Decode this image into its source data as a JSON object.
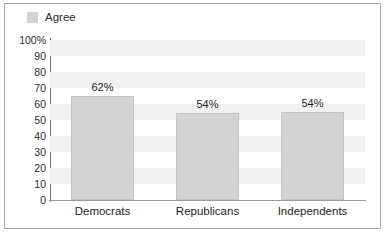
{
  "chart_data": {
    "type": "bar",
    "title": "",
    "xlabel": "",
    "ylabel": "",
    "categories": [
      "Democrats",
      "Republicans",
      "Independents"
    ],
    "values": [
      62,
      54,
      54
    ],
    "bar_heights": [
      65,
      54.5,
      55
    ],
    "data_labels": [
      "62%",
      "54%",
      "54%"
    ],
    "series": [
      {
        "name": "Agree",
        "values": [
          62,
          54,
          54
        ]
      }
    ],
    "ylim": [
      0,
      100
    ],
    "ytick_values": [
      100,
      90,
      80,
      70,
      60,
      50,
      40,
      30,
      20,
      10,
      0
    ],
    "ytick_labels": [
      "100%",
      "90",
      "80",
      "70",
      "60",
      "50",
      "40",
      "30",
      "20",
      "10",
      "0"
    ],
    "grid": false,
    "banded_background": true,
    "legend_position": "top-left",
    "bar_color": "#d3d3d3",
    "band_color": "#f1f1f1",
    "axis_color": "#6f6f6f",
    "border_color": "#a8a8a8"
  },
  "legend": {
    "label": "Agree",
    "swatch_color": "#d2d2d2"
  }
}
